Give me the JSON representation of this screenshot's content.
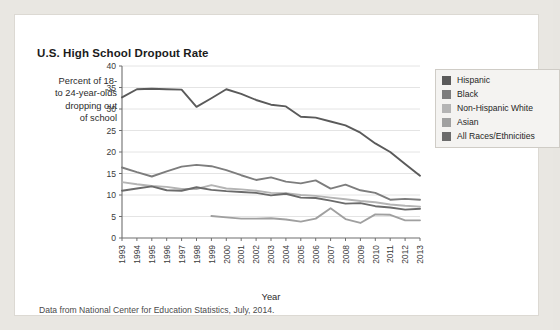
{
  "card": {
    "title": "U.S. High School Dropout Rate",
    "y_axis_label": "Percent of 18- to 24-year-olds dropping out of school",
    "y_axis_label_lines": [
      "Percent of 18-",
      "to 24-year-olds",
      "dropping out",
      "of school"
    ],
    "caption": "Data from National Center for Education Statistics, July, 2014."
  },
  "legend": {
    "position": "top-right",
    "items": [
      {
        "label": "Hispanic",
        "color": "#5a5a5a"
      },
      {
        "label": "Black",
        "color": "#7d7d7d"
      },
      {
        "label": "Non-Hispanic White",
        "color": "#b4b4b4"
      },
      {
        "label": "Asian",
        "color": "#a0a0a0"
      },
      {
        "label": "All Races/Ethnicities",
        "color": "#6b6b6b"
      }
    ]
  },
  "chart_data": {
    "type": "line",
    "title": "U.S. High School Dropout Rate",
    "xlabel": "Year",
    "ylabel": "Percent of 18- to 24-year-olds dropping out of school",
    "xlim": [
      1993,
      2013
    ],
    "ylim": [
      0,
      40
    ],
    "yticks": [
      0,
      5,
      10,
      15,
      20,
      25,
      30,
      35,
      40
    ],
    "grid": true,
    "legend_position": "top-right",
    "categories": [
      1993,
      1994,
      1995,
      1996,
      1997,
      1998,
      1999,
      2000,
      2001,
      2002,
      2003,
      2004,
      2005,
      2006,
      2007,
      2008,
      2009,
      2010,
      2011,
      2012,
      2013
    ],
    "x_tick_labels": [
      "1993",
      "1994",
      "1995",
      "1996",
      "1997",
      "1998",
      "1999",
      "2000",
      "2001",
      "2002",
      "2003",
      "2004",
      "2005",
      "2006",
      "2007",
      "2008",
      "2009",
      "2010",
      "2011",
      "2012",
      "2013"
    ],
    "series": [
      {
        "name": "Hispanic",
        "color": "#5a5a5a",
        "values": [
          32.7,
          34.6,
          34.7,
          34.6,
          34.5,
          30.5,
          32.5,
          34.6,
          33.5,
          32.1,
          31.0,
          30.6,
          28.2,
          28.0,
          27.1,
          26.2,
          24.5,
          22.0,
          20.0,
          17.2,
          14.5
        ]
      },
      {
        "name": "Black",
        "color": "#7d7d7d",
        "values": [
          16.4,
          15.3,
          14.3,
          15.5,
          16.6,
          17.0,
          16.7,
          15.8,
          14.6,
          13.5,
          14.1,
          13.1,
          12.7,
          13.4,
          11.5,
          12.4,
          11.1,
          10.5,
          8.9,
          9.1,
          8.9
        ]
      },
      {
        "name": "Non-Hispanic White",
        "color": "#b4b4b4",
        "values": [
          13.0,
          12.5,
          12.1,
          11.9,
          11.4,
          11.4,
          12.3,
          11.5,
          11.3,
          11.0,
          10.5,
          10.4,
          10.0,
          9.8,
          9.4,
          9.0,
          8.6,
          8.3,
          7.8,
          7.5,
          7.3
        ]
      },
      {
        "name": "Asian",
        "color": "#a0a0a0",
        "values": [
          null,
          null,
          null,
          null,
          null,
          null,
          5.1,
          4.8,
          4.5,
          4.5,
          4.6,
          4.3,
          3.8,
          4.5,
          6.9,
          4.4,
          3.5,
          5.5,
          5.4,
          4.1,
          4.1
        ]
      },
      {
        "name": "All Races/Ethnicities",
        "color": "#6b6b6b",
        "values": [
          11.0,
          11.5,
          12.0,
          11.1,
          11.0,
          11.8,
          11.2,
          10.9,
          10.7,
          10.5,
          9.9,
          10.3,
          9.4,
          9.3,
          8.7,
          8.0,
          8.1,
          7.4,
          7.1,
          6.6,
          6.8
        ]
      }
    ]
  }
}
